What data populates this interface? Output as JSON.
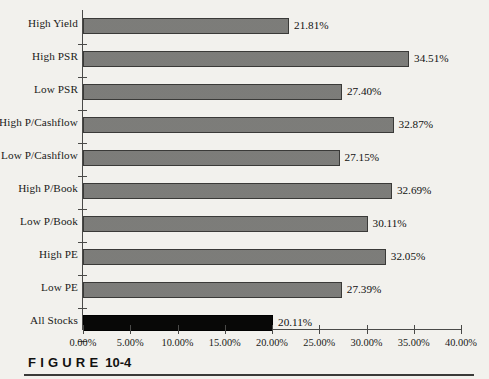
{
  "caption": {
    "word": "FIGURE",
    "number": "10-4"
  },
  "chart_data": {
    "type": "bar",
    "orientation": "horizontal",
    "title": "",
    "subtitle": "",
    "xlabel": "",
    "ylabel": "",
    "grid": false,
    "legend": false,
    "xlim": [
      0,
      40
    ],
    "xtick_labels": [
      "0.00%",
      "5.00%",
      "10.00%",
      "15.00%",
      "20.00%",
      "25.00%",
      "30.00%",
      "35.00%",
      "40.00%"
    ],
    "xticks": [
      0,
      5,
      10,
      15,
      20,
      25,
      30,
      35,
      40
    ],
    "categories": [
      "High Yield",
      "High PSR",
      "Low PSR",
      "High P/Cashflow",
      "Low P/Cashflow",
      "High P/Book",
      "Low P/Book",
      "High PE",
      "Low PE",
      "All Stocks"
    ],
    "values": [
      21.81,
      34.51,
      27.4,
      32.87,
      27.15,
      32.69,
      30.11,
      32.05,
      27.39,
      20.11
    ],
    "value_labels": [
      "21.81%",
      "34.51%",
      "27.40%",
      "32.87%",
      "27.15%",
      "32.69%",
      "30.11%",
      "32.05%",
      "27.39%",
      "20.11%"
    ],
    "bar_colors": [
      "#7d7d7a",
      "#7d7d7a",
      "#7d7d7a",
      "#7d7d7a",
      "#7d7d7a",
      "#7d7d7a",
      "#7d7d7a",
      "#7d7d7a",
      "#7d7d7a",
      "#080807"
    ],
    "highlight_index": 9,
    "colors": {
      "bar_gray": "#7d7d7a",
      "bar_black": "#080807",
      "axis": "#4a4a48",
      "text": "#1a1a18",
      "background": "#f3f2ee"
    }
  }
}
